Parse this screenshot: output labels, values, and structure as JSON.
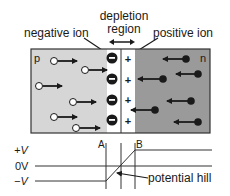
{
  "labels": {
    "depletion_line1": "depletion",
    "depletion_line2": "region",
    "negative_ion": "negative ion",
    "positive_ion": "positive ion",
    "p_region": "p",
    "n_region": "n",
    "point_a": "A",
    "point_b": "B",
    "plus_v": "+V",
    "zero_v": "0V",
    "minus_v": "−V",
    "potential_hill": "potential hill"
  },
  "symbols": {
    "minus": "−",
    "plus": "+"
  },
  "colors": {
    "p_region": "#d6d6d6",
    "n_region": "#9a9a9a",
    "depletion": "#ffffff",
    "ink": "#1a1a1a"
  }
}
